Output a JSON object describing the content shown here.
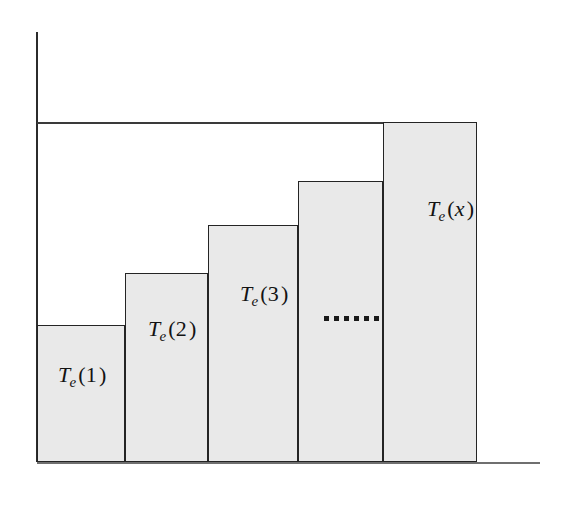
{
  "figure": {
    "title": "",
    "background_color": "#ffffff",
    "width": 577,
    "height": 510
  },
  "axes": {
    "y_axis": {
      "name": "y-axis",
      "color": "#2b2b2b",
      "x": 37,
      "y_top": 32,
      "y_bottom": 462
    },
    "x_axis": {
      "name": "x-axis",
      "color": "#6f6f6f",
      "y": 462,
      "x_left": 37,
      "x_right": 540
    },
    "top_reference_line": {
      "name": "top-reference-line",
      "color": "#3a3a3a",
      "y": 122,
      "x_left": 37,
      "x_right": 477
    }
  },
  "chart_data": {
    "type": "bar",
    "title": "",
    "xlabel": "",
    "ylabel": "",
    "grid": false,
    "legend": "none",
    "bar_fill_color": "#e9e9e9",
    "bar_edge_color": "#242424",
    "baseline_y": 462,
    "xlim": [
      37,
      540
    ],
    "ylim": [
      122,
      462
    ],
    "categories": [
      "1",
      "2",
      "3",
      "...",
      "x"
    ],
    "labels": [
      "T_e(1)",
      "T_e(2)",
      "T_e(3)",
      "",
      "T_e(x)"
    ],
    "values": [
      137,
      189,
      237,
      281,
      340
    ],
    "bars": [
      {
        "index": 1,
        "label_base": "T",
        "label_sub": "e",
        "label_arg": "1",
        "arg_italic": false,
        "x_left": 37,
        "x_right": 125,
        "top": 325,
        "height": 137
      },
      {
        "index": 2,
        "label_base": "T",
        "label_sub": "e",
        "label_arg": "2",
        "arg_italic": false,
        "x_left": 125,
        "x_right": 208,
        "top": 273,
        "height": 189
      },
      {
        "index": 3,
        "label_base": "T",
        "label_sub": "e",
        "label_arg": "3",
        "arg_italic": false,
        "x_left": 208,
        "x_right": 298,
        "top": 225,
        "height": 237
      },
      {
        "index": 4,
        "label_base": "",
        "label_sub": "",
        "label_arg": "",
        "arg_italic": false,
        "x_left": 298,
        "x_right": 383,
        "top": 181,
        "height": 281
      },
      {
        "index": 5,
        "label_base": "T",
        "label_sub": "e",
        "label_arg": "x",
        "arg_italic": true,
        "x_left": 383,
        "x_right": 477,
        "top": 122,
        "height": 340
      }
    ],
    "annotations": [
      {
        "type": "ellipsis",
        "name": "ellipsis-dots",
        "dot_count": 6,
        "x": 324,
        "y": 316,
        "meaning": "continuation"
      }
    ]
  },
  "labels": {
    "bar1": {
      "base": "T",
      "sub": "e",
      "open": "(",
      "arg": "1",
      "close": ")"
    },
    "bar2": {
      "base": "T",
      "sub": "e",
      "open": "(",
      "arg": "2",
      "close": ")"
    },
    "bar3": {
      "base": "T",
      "sub": "e",
      "open": "(",
      "arg": "3",
      "close": ")"
    },
    "bar5": {
      "base": "T",
      "sub": "e",
      "open": "(",
      "arg": "x",
      "close": ")"
    }
  }
}
